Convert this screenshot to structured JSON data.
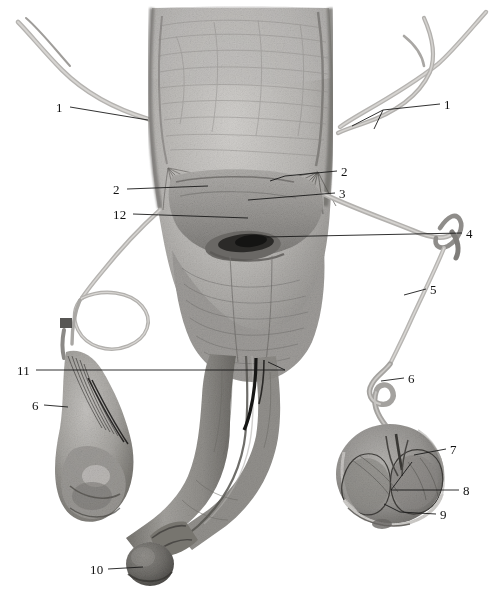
{
  "figure": {
    "background_color": "#ffffff",
    "label_color": "#111111",
    "leader_color": "#1a1a1a",
    "tissue_light": "#c8c6c3",
    "tissue_mid": "#a8a6a3",
    "tissue_dark": "#7d7b78",
    "tissue_shadow": "#58565 4",
    "cord_color": "#b9b7b4"
  },
  "labels": [
    {
      "id": "label-1-left",
      "text": "1",
      "x": 56,
      "y": 101
    },
    {
      "id": "label-1-right",
      "text": "1",
      "x": 444,
      "y": 98
    },
    {
      "id": "label-2-left",
      "text": "2",
      "x": 113,
      "y": 183
    },
    {
      "id": "label-2-right",
      "text": "2",
      "x": 341,
      "y": 165
    },
    {
      "id": "label-3-right",
      "text": "3",
      "x": 339,
      "y": 187
    },
    {
      "id": "label-12-left",
      "text": "12",
      "x": 113,
      "y": 208
    },
    {
      "id": "label-4-right",
      "text": "4",
      "x": 466,
      "y": 227
    },
    {
      "id": "label-5-right",
      "text": "5",
      "x": 430,
      "y": 283
    },
    {
      "id": "label-11-left",
      "text": "11",
      "x": 17,
      "y": 364
    },
    {
      "id": "label-6-right",
      "text": "6",
      "x": 408,
      "y": 372
    },
    {
      "id": "label-6-left",
      "text": "6",
      "x": 32,
      "y": 399
    },
    {
      "id": "label-7-right",
      "text": "7",
      "x": 450,
      "y": 443
    },
    {
      "id": "label-8-right",
      "text": "8",
      "x": 463,
      "y": 484
    },
    {
      "id": "label-9-right",
      "text": "9",
      "x": 440,
      "y": 508
    },
    {
      "id": "label-10-left",
      "text": "10",
      "x": 90,
      "y": 563
    }
  ],
  "leader_lines": [
    {
      "name": "leader-1-left",
      "points": "70,107 148,120"
    },
    {
      "name": "leader-1-right",
      "points": "440,104 383,110 352,126"
    },
    {
      "name": "leader-1-right-branch",
      "points": "383,110 374,129"
    },
    {
      "name": "leader-2-left",
      "points": "127,189 208,186"
    },
    {
      "name": "leader-2-right",
      "points": "337,171 285,176 270,181"
    },
    {
      "name": "leader-3-right",
      "points": "335,193 248,200"
    },
    {
      "name": "leader-12-left",
      "points": "133,214 248,218"
    },
    {
      "name": "leader-4-right",
      "points": "462,233 265,237"
    },
    {
      "name": "leader-5-right",
      "points": "426,289 404,295"
    },
    {
      "name": "leader-11-left",
      "points": "36,370 285,370"
    },
    {
      "name": "leader-11-tip",
      "points": "285,370 272,364"
    },
    {
      "name": "leader-6-right",
      "points": "404,378 381,381"
    },
    {
      "name": "leader-6-left",
      "points": "44,405 68,407"
    },
    {
      "name": "leader-7-right",
      "points": "446,449 414,455"
    },
    {
      "name": "leader-8-right",
      "points": "459,490 391,490"
    },
    {
      "name": "leader-8-tip",
      "points": "391,490 412,462"
    },
    {
      "name": "leader-9-right",
      "points": "436,514 400,512"
    },
    {
      "name": "leader-9-branch",
      "points": "400,512 386,506"
    },
    {
      "name": "leader-10-left",
      "points": "108,569 143,567"
    }
  ]
}
